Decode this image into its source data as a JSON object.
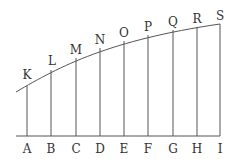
{
  "diagram": {
    "colors": {
      "line": "#555555",
      "text": "#333333",
      "background": "#ffffff"
    },
    "bottom_labels": [
      "A",
      "B",
      "C",
      "D",
      "E",
      "F",
      "G",
      "H",
      "I"
    ],
    "top_labels": [
      "K",
      "L",
      "M",
      "N",
      "O",
      "P",
      "Q",
      "R",
      "S"
    ],
    "ordinates": [
      {
        "x": 27,
        "top_y": 86,
        "bottom": "A",
        "top": "K"
      },
      {
        "x": 51,
        "top_y": 70,
        "bottom": "B",
        "top": "L"
      },
      {
        "x": 76,
        "top_y": 58,
        "bottom": "C",
        "top": "M"
      },
      {
        "x": 100,
        "top_y": 48,
        "bottom": "D",
        "top": "N"
      },
      {
        "x": 124,
        "top_y": 41,
        "bottom": "E",
        "top": "O"
      },
      {
        "x": 148,
        "top_y": 35,
        "bottom": "F",
        "top": "P"
      },
      {
        "x": 173,
        "top_y": 30,
        "bottom": "G",
        "top": "Q"
      },
      {
        "x": 197,
        "top_y": 27,
        "bottom": "H",
        "top": "R"
      },
      {
        "x": 220,
        "top_y": 24,
        "bottom": "I",
        "top": "S"
      }
    ],
    "baseline": {
      "x1": 16,
      "x2": 220,
      "y": 136
    }
  }
}
